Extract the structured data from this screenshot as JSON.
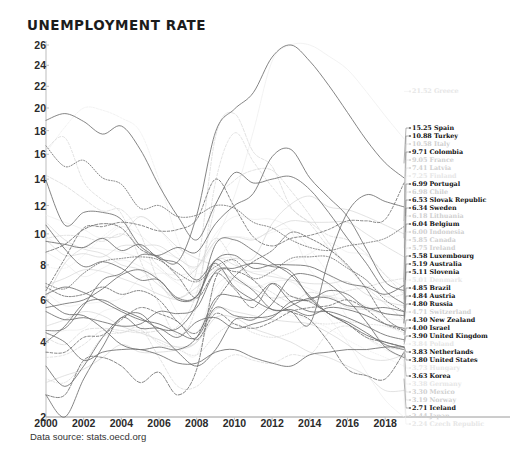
{
  "header": {
    "title": "UNEMPLOYMENT RATE"
  },
  "footer": {
    "source": "Data source: stats.oecd.org"
  },
  "chart_data": {
    "type": "line",
    "title": "UNEMPLOYMENT RATE",
    "xlabel": "",
    "ylabel": "",
    "grid": false,
    "legend_position": "right-inline-labels",
    "x": [
      2000,
      2001,
      2002,
      2003,
      2004,
      2005,
      2006,
      2007,
      2008,
      2009,
      2010,
      2011,
      2012,
      2013,
      2014,
      2015,
      2016,
      2017,
      2018,
      2019
    ],
    "xticks": [
      2000,
      2002,
      2004,
      2006,
      2008,
      2010,
      2012,
      2014,
      2016,
      2018
    ],
    "yticks": [
      2,
      4,
      6,
      8,
      10,
      12,
      14,
      16,
      18,
      20,
      22,
      24,
      26
    ],
    "ylim": [
      2,
      26
    ],
    "yscale": "compressed-upper",
    "value_unit": "percent",
    "end_year": 2019,
    "series": [
      {
        "name": "Greece",
        "emphasis": "xlo",
        "label": "21.52 Greece",
        "end_value": 21.52,
        "values": [
          11.3,
          10.8,
          10.3,
          9.7,
          10.5,
          9.9,
          8.9,
          8.4,
          7.8,
          9.6,
          12.7,
          17.9,
          24.4,
          27.5,
          26.5,
          24.9,
          23.6,
          21.5,
          19.3,
          17.3
        ]
      },
      {
        "name": "Spain",
        "emphasis": "hi",
        "label": "15.25 Spain",
        "end_value": 15.25,
        "values": [
          13.9,
          10.6,
          11.5,
          11.5,
          11.0,
          9.2,
          8.5,
          8.2,
          11.3,
          17.9,
          19.9,
          21.4,
          24.8,
          26.1,
          24.4,
          22.1,
          19.6,
          17.2,
          15.3,
          14.1
        ]
      },
      {
        "name": "Turkey",
        "emphasis": "hi",
        "label": "10.88 Turkey",
        "end_value": 10.88,
        "values": [
          6.5,
          8.4,
          10.4,
          10.5,
          10.8,
          10.6,
          10.2,
          10.3,
          11.0,
          14.0,
          11.9,
          9.8,
          9.2,
          9.7,
          9.9,
          10.3,
          10.9,
          10.9,
          11.0,
          13.7
        ]
      },
      {
        "name": "Italy",
        "emphasis": "lo",
        "label": "10.58 Italy",
        "end_value": 10.58,
        "values": [
          10.8,
          9.6,
          9.0,
          8.7,
          8.0,
          7.7,
          6.8,
          6.1,
          6.7,
          7.7,
          8.4,
          8.4,
          10.7,
          12.1,
          12.7,
          11.9,
          11.7,
          11.2,
          10.6,
          10.0
        ]
      },
      {
        "name": "Colombia",
        "emphasis": "hi",
        "label": "9.71 Colombia",
        "end_value": 9.71,
        "values": [
          16.7,
          15.0,
          15.5,
          14.1,
          13.6,
          11.8,
          12.0,
          11.2,
          11.3,
          12.0,
          11.8,
          10.8,
          10.4,
          9.6,
          9.1,
          8.9,
          9.2,
          9.4,
          9.7,
          10.5
        ]
      },
      {
        "name": "France",
        "emphasis": "lo",
        "label": "9.05 France",
        "end_value": 9.05,
        "values": [
          9.6,
          8.6,
          8.7,
          8.5,
          9.2,
          9.2,
          9.2,
          8.4,
          7.9,
          9.5,
          9.8,
          9.6,
          10.3,
          10.9,
          10.8,
          10.8,
          10.8,
          10.0,
          9.2,
          8.5
        ]
      },
      {
        "name": "Latvia",
        "emphasis": "lo",
        "label": "7.41 Latvia",
        "end_value": 7.41,
        "values": [
          14.3,
          13.5,
          12.5,
          11.6,
          11.7,
          10.0,
          7.0,
          6.1,
          7.7,
          17.5,
          19.5,
          16.2,
          15.0,
          11.9,
          10.8,
          9.9,
          9.6,
          8.7,
          7.4,
          6.3
        ]
      },
      {
        "name": "Finland",
        "emphasis": "xlo",
        "label": "7.25 Finland",
        "end_value": 7.25,
        "values": [
          9.8,
          9.1,
          9.1,
          9.0,
          8.8,
          8.4,
          7.7,
          6.9,
          6.4,
          8.2,
          8.4,
          7.8,
          7.7,
          8.2,
          8.7,
          9.4,
          8.8,
          8.6,
          7.4,
          6.7
        ]
      },
      {
        "name": "Portugal",
        "emphasis": "hi",
        "label": "6.99 Portugal",
        "end_value": 6.99,
        "values": [
          4.5,
          4.6,
          5.7,
          7.1,
          7.5,
          8.6,
          8.6,
          9.1,
          8.8,
          10.7,
          12.0,
          12.9,
          15.8,
          16.4,
          14.1,
          12.6,
          11.2,
          9.0,
          7.0,
          6.5
        ]
      },
      {
        "name": "Chile",
        "emphasis": "lo",
        "label": "6.98 Chile",
        "end_value": 6.98,
        "values": [
          9.7,
          9.9,
          9.8,
          9.5,
          10.0,
          9.2,
          7.9,
          7.1,
          7.8,
          9.7,
          8.2,
          7.1,
          6.4,
          5.9,
          6.4,
          6.2,
          6.5,
          6.7,
          7.0,
          7.2
        ]
      },
      {
        "name": "Slovak Republic",
        "emphasis": "hi",
        "label": "6.53 Slovak Republic",
        "end_value": 6.53,
        "values": [
          18.9,
          19.5,
          18.8,
          17.7,
          18.4,
          16.4,
          13.5,
          11.2,
          9.6,
          12.1,
          14.5,
          13.7,
          14.0,
          14.2,
          13.2,
          11.5,
          9.7,
          8.1,
          6.5,
          5.8
        ]
      },
      {
        "name": "Sweden",
        "emphasis": "hi",
        "label": "6.34 Sweden",
        "end_value": 6.34,
        "values": [
          5.6,
          5.8,
          6.0,
          6.6,
          7.4,
          7.7,
          7.1,
          6.1,
          6.2,
          8.3,
          8.6,
          7.8,
          8.0,
          8.0,
          7.9,
          7.4,
          6.9,
          6.7,
          6.3,
          6.8
        ]
      },
      {
        "name": "Lithuania",
        "emphasis": "lo",
        "label": "6.18 Lithuania",
        "end_value": 6.18,
        "values": [
          16.4,
          17.4,
          13.8,
          12.4,
          11.4,
          8.3,
          5.8,
          4.3,
          5.8,
          13.8,
          17.8,
          15.4,
          13.4,
          11.8,
          10.7,
          9.1,
          7.9,
          7.1,
          6.2,
          6.3
        ]
      },
      {
        "name": "Indonesia",
        "emphasis": "lo",
        "label": "6.00 Indonesia",
        "end_value": 6.0,
        "values": [
          6.1,
          8.1,
          9.1,
          9.7,
          9.9,
          11.2,
          10.3,
          9.1,
          8.4,
          7.9,
          7.1,
          6.6,
          6.1,
          6.2,
          5.9,
          6.2,
          5.6,
          5.5,
          5.3,
          5.2
        ]
      },
      {
        "name": "Belgium",
        "emphasis": "hi",
        "label": "6.04 Belgium",
        "end_value": 6.04,
        "values": [
          6.9,
          6.6,
          7.5,
          8.2,
          8.4,
          8.5,
          8.3,
          7.5,
          7.0,
          7.9,
          8.3,
          7.2,
          7.6,
          8.4,
          8.5,
          8.5,
          7.8,
          7.1,
          6.0,
          5.4
        ]
      },
      {
        "name": "Canada",
        "emphasis": "lo",
        "label": "5.85 Canada",
        "end_value": 5.85,
        "values": [
          6.8,
          7.2,
          7.7,
          7.6,
          7.2,
          6.8,
          6.3,
          6.0,
          6.1,
          8.3,
          8.0,
          7.5,
          7.3,
          7.1,
          6.9,
          6.9,
          7.0,
          6.3,
          5.9,
          5.7
        ]
      },
      {
        "name": "Ireland",
        "emphasis": "lo",
        "label": "5.75 Ireland",
        "end_value": 5.75,
        "values": [
          4.2,
          3.9,
          4.5,
          4.6,
          4.5,
          4.4,
          4.5,
          4.7,
          6.4,
          12.0,
          13.9,
          14.7,
          14.7,
          13.1,
          11.3,
          9.4,
          7.9,
          6.7,
          5.8,
          5.0
        ]
      },
      {
        "name": "Luxembourg",
        "emphasis": "hi",
        "label": "5.58 Luxembourg",
        "end_value": 5.58,
        "values": [
          2.3,
          1.9,
          2.7,
          3.8,
          5.1,
          4.6,
          4.6,
          4.2,
          4.9,
          5.1,
          4.6,
          4.8,
          5.1,
          5.9,
          6.0,
          6.5,
          6.3,
          5.6,
          5.6,
          5.4
        ]
      },
      {
        "name": "Australia",
        "emphasis": "hi",
        "label": "5.19 Australia",
        "end_value": 5.19,
        "values": [
          6.3,
          6.7,
          6.4,
          5.9,
          5.4,
          5.0,
          4.8,
          4.4,
          4.2,
          5.6,
          5.2,
          5.1,
          5.2,
          5.7,
          6.1,
          6.1,
          5.7,
          5.6,
          5.3,
          5.2
        ]
      },
      {
        "name": "Slovenia",
        "emphasis": "hi",
        "label": "5.11 Slovenia",
        "end_value": 5.11,
        "values": [
          6.7,
          6.2,
          6.3,
          6.7,
          6.3,
          6.5,
          6.0,
          4.9,
          4.4,
          5.9,
          7.3,
          8.2,
          8.9,
          10.1,
          9.7,
          9.0,
          8.0,
          6.6,
          5.1,
          4.5
        ]
      },
      {
        "name": "Denmark",
        "emphasis": "xlo",
        "label": "5.01 Denmark",
        "end_value": 5.01,
        "values": [
          4.3,
          4.5,
          4.6,
          5.4,
          5.5,
          4.8,
          3.9,
          3.8,
          3.5,
          6.0,
          7.5,
          7.6,
          7.5,
          7.0,
          6.6,
          6.2,
          6.0,
          5.7,
          5.1,
          5.0
        ]
      },
      {
        "name": "Brazil",
        "emphasis": "hi",
        "label": "4.85 Brazil",
        "end_value": 4.85,
        "values": [
          9.5,
          9.3,
          9.1,
          9.7,
          8.9,
          9.3,
          8.4,
          8.1,
          7.1,
          8.1,
          6.7,
          6.0,
          5.5,
          5.4,
          4.8,
          8.3,
          11.5,
          12.8,
          12.3,
          11.9
        ]
      },
      {
        "name": "Austria",
        "emphasis": "hi",
        "label": "4.84 Austria",
        "end_value": 4.84,
        "values": [
          3.6,
          3.6,
          4.2,
          4.3,
          5.0,
          5.6,
          5.3,
          4.9,
          4.1,
          5.3,
          4.8,
          4.6,
          4.9,
          5.4,
          5.6,
          5.7,
          6.0,
          5.5,
          4.8,
          4.5
        ]
      },
      {
        "name": "Russia",
        "emphasis": "hi",
        "label": "4.80 Russia",
        "end_value": 4.8,
        "values": [
          10.6,
          9.0,
          7.9,
          8.2,
          7.8,
          7.1,
          7.1,
          6.0,
          6.2,
          8.3,
          7.3,
          6.5,
          5.5,
          5.5,
          5.2,
          5.6,
          5.5,
          5.2,
          4.8,
          4.6
        ]
      },
      {
        "name": "Switzerland",
        "emphasis": "lo",
        "label": "4.71 Switzerland",
        "end_value": 4.71,
        "values": [
          2.7,
          2.6,
          3.2,
          4.2,
          4.4,
          4.5,
          4.0,
          3.7,
          3.5,
          4.3,
          4.8,
          4.4,
          4.2,
          4.4,
          4.8,
          4.8,
          4.9,
          4.8,
          4.7,
          4.4
        ]
      },
      {
        "name": "New Zealand",
        "emphasis": "hi",
        "label": "4.30 New Zealand",
        "end_value": 4.3,
        "values": [
          6.0,
          5.3,
          5.2,
          4.6,
          3.9,
          3.7,
          3.8,
          3.7,
          4.2,
          6.1,
          6.2,
          6.0,
          6.9,
          5.9,
          5.4,
          5.4,
          5.1,
          4.7,
          4.3,
          4.1
        ]
      },
      {
        "name": "Israel",
        "emphasis": "hi",
        "label": "4.00 Israel",
        "end_value": 4.0,
        "values": [
          8.8,
          9.3,
          10.3,
          10.7,
          10.4,
          9.0,
          8.4,
          7.3,
          6.1,
          7.5,
          6.6,
          5.6,
          6.9,
          6.2,
          5.9,
          5.3,
          4.8,
          4.2,
          4.0,
          3.8
        ]
      },
      {
        "name": "United Kingdom",
        "emphasis": "hi",
        "label": "3.90 United Kingdom",
        "end_value": 3.9,
        "values": [
          5.4,
          5.0,
          5.1,
          4.9,
          4.7,
          4.8,
          5.4,
          5.3,
          5.6,
          7.6,
          7.8,
          8.1,
          7.9,
          7.6,
          6.1,
          5.3,
          4.8,
          4.3,
          4.0,
          3.8
        ]
      },
      {
        "name": "United States",
        "emphasis": "hi",
        "label": "3.80 United States",
        "end_value": 3.8,
        "values": [
          4.0,
          4.7,
          5.8,
          6.0,
          5.5,
          5.1,
          4.6,
          4.6,
          5.8,
          9.3,
          9.6,
          8.9,
          8.1,
          7.4,
          6.2,
          5.3,
          4.9,
          4.4,
          3.9,
          3.7
        ]
      },
      {
        "name": "Poland",
        "emphasis": "xlo",
        "label": "3.84 Poland",
        "end_value": 3.84,
        "values": [
          16.1,
          18.3,
          20.0,
          19.8,
          19.1,
          17.9,
          13.9,
          9.6,
          7.1,
          8.1,
          9.7,
          9.7,
          10.1,
          10.3,
          9.0,
          7.5,
          6.2,
          4.9,
          3.9,
          3.3
        ]
      },
      {
        "name": "Korea",
        "emphasis": "hi",
        "label": "3.63 Korea",
        "end_value": 3.63,
        "values": [
          4.4,
          4.0,
          3.3,
          3.6,
          3.7,
          3.7,
          3.5,
          3.2,
          3.2,
          3.6,
          3.7,
          3.4,
          3.2,
          3.1,
          3.5,
          3.6,
          3.7,
          3.7,
          3.8,
          3.8
        ]
      },
      {
        "name": "Netherlands",
        "emphasis": "hi",
        "label": "3.83 Netherlands",
        "end_value": 3.83,
        "values": [
          3.1,
          2.5,
          3.1,
          4.2,
          5.1,
          5.3,
          4.4,
          3.6,
          3.1,
          3.7,
          5.0,
          5.0,
          5.8,
          7.3,
          7.4,
          6.9,
          6.0,
          4.9,
          3.8,
          3.4
        ]
      },
      {
        "name": "Norway",
        "emphasis": "lo",
        "label": "3.19 Norway",
        "end_value": 3.19,
        "values": [
          3.4,
          3.5,
          3.9,
          4.5,
          4.4,
          4.6,
          3.4,
          2.5,
          2.5,
          3.1,
          3.5,
          3.3,
          3.2,
          3.5,
          3.5,
          4.4,
          4.7,
          4.2,
          3.8,
          3.7
        ]
      },
      {
        "name": "Hungary",
        "emphasis": "xlo",
        "label": "3.73 Hungary",
        "end_value": 3.73,
        "values": [
          6.4,
          5.7,
          5.8,
          5.9,
          6.1,
          7.2,
          7.5,
          7.4,
          7.8,
          10.0,
          11.2,
          11.0,
          11.0,
          10.2,
          7.7,
          6.8,
          5.1,
          4.2,
          3.7,
          3.4
        ]
      },
      {
        "name": "Germany",
        "emphasis": "xlo",
        "label": "3.38 Germany",
        "end_value": 3.38,
        "values": [
          7.9,
          7.8,
          8.6,
          9.8,
          10.7,
          11.2,
          10.3,
          8.7,
          7.5,
          7.7,
          7.0,
          5.8,
          5.4,
          5.2,
          5.0,
          4.6,
          4.1,
          3.7,
          3.4,
          3.1
        ]
      },
      {
        "name": "Mexico",
        "emphasis": "lo",
        "label": "3.30 Mexico",
        "end_value": 3.3,
        "values": [
          2.6,
          2.8,
          3.0,
          3.4,
          3.9,
          3.6,
          3.6,
          3.7,
          4.0,
          5.5,
          5.4,
          5.2,
          5.0,
          4.9,
          4.8,
          4.4,
          3.9,
          3.4,
          3.3,
          3.5
        ]
      },
      {
        "name": "Iceland",
        "emphasis": "hi",
        "label": "2.71 Iceland",
        "end_value": 2.71,
        "values": [
          2.3,
          2.3,
          3.3,
          3.4,
          3.1,
          2.6,
          2.9,
          2.3,
          3.0,
          7.2,
          7.6,
          7.1,
          6.0,
          5.4,
          5.0,
          4.0,
          3.0,
          2.8,
          2.7,
          3.6
        ]
      },
      {
        "name": "Japan",
        "emphasis": "lo",
        "label": "2.44 Japan",
        "end_value": 2.44,
        "values": [
          4.7,
          5.0,
          5.4,
          5.2,
          4.7,
          4.4,
          4.1,
          3.8,
          4.0,
          5.1,
          5.1,
          4.6,
          4.3,
          4.0,
          3.6,
          3.4,
          3.1,
          2.8,
          2.4,
          2.4
        ]
      },
      {
        "name": "Czech Republic",
        "emphasis": "xlo",
        "label": "2.24 Czech Republic",
        "end_value": 2.24,
        "values": [
          8.8,
          8.1,
          7.3,
          7.8,
          8.3,
          7.9,
          7.1,
          5.3,
          4.4,
          6.7,
          7.3,
          6.7,
          7.0,
          7.0,
          6.1,
          5.1,
          4.0,
          2.9,
          2.2,
          2.0
        ]
      }
    ]
  }
}
